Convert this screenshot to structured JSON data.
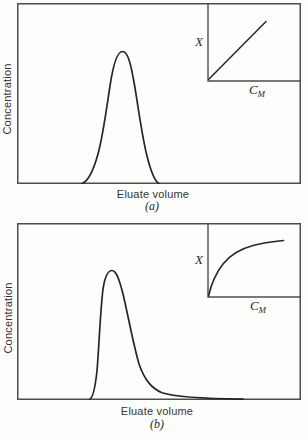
{
  "figure": {
    "type": "two-panel scientific diagram",
    "ink_color": "#262626",
    "frame_color": "#4d4d4d",
    "background": "#fdfdfc"
  },
  "panels": [
    {
      "id": "a",
      "y_axis_label": "Concentration",
      "x_axis_label": "Eluate volume",
      "caption": "(a)",
      "peak_shape": "narrow symmetric gaussian elution peak",
      "inset": {
        "y_label": "X",
        "x_label_base": "C",
        "x_label_sub": "M",
        "curve_type": "linear isotherm (straight diagonal line)"
      }
    },
    {
      "id": "b",
      "y_axis_label": "Concentration",
      "x_axis_label": "Eluate volume",
      "caption": "(b)",
      "peak_shape": "asymmetric elution peak with sharp front and long tail",
      "inset": {
        "y_label": "X",
        "x_label_base": "C",
        "x_label_sub": "M",
        "curve_type": "convex saturation isotherm (langmuir-like curve)"
      }
    }
  ]
}
